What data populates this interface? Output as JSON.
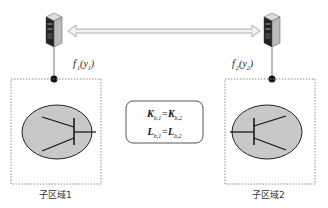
{
  "diagram": {
    "nodes": [
      {
        "id": "server-1",
        "label": "f'₁(y₁)",
        "label_main": "f",
        "label_sup": "'",
        "label_sub": "1",
        "label_arg": "(y",
        "label_arg_sub": "1",
        "label_close": ")"
      },
      {
        "id": "server-2",
        "label": "f'₂(y₂)",
        "label_main": "f",
        "label_sup": "'",
        "label_sub": "2",
        "label_arg": "(y",
        "label_arg_sub": "2",
        "label_close": ")"
      }
    ],
    "regions": [
      {
        "id": "sub-region-1",
        "label": "子区域1"
      },
      {
        "id": "sub-region-2",
        "label": "子区域2"
      }
    ],
    "equations": {
      "line1": {
        "lhs": "K",
        "lhs_sub": "b,1",
        "op": "=",
        "rhs": "K",
        "rhs_sub": "b,2"
      },
      "line2": {
        "lhs": "L",
        "lhs_sub": "b,1",
        "op": "=",
        "rhs": "L",
        "rhs_sub": "b,2"
      }
    },
    "colors": {
      "ellipse_fill": "#c8c8c8",
      "line": "#222222",
      "arrow_fill": "#eeeeee",
      "dotted_border": "#888888"
    }
  }
}
